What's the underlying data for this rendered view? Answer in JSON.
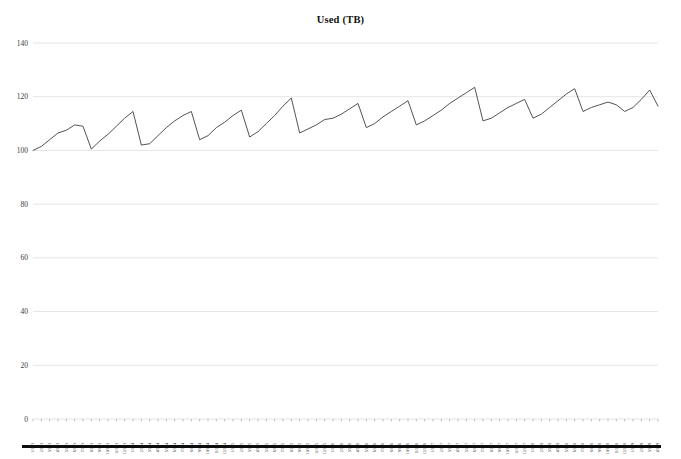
{
  "chart": {
    "title": "Used (TB)",
    "bottom_bar_color": "#0d0d0d",
    "line_color": "#3f3f3f",
    "grid_color": "#d9d9d9"
  },
  "chart_data": {
    "type": "line",
    "title": "Used (TB)",
    "xlabel": "",
    "ylabel": "",
    "ylim": [
      0,
      140
    ],
    "ytick_labels": [
      "0",
      "20",
      "40",
      "60",
      "80",
      "100",
      "120",
      "140"
    ],
    "yticks": [
      0,
      20,
      40,
      60,
      80,
      100,
      120,
      140
    ],
    "grid": true,
    "legend": "none",
    "series_name": "Used (TB)",
    "categories": [
      "1/1/13",
      "2/1/13",
      "3/1/13",
      "4/1/13",
      "5/1/13",
      "6/1/13",
      "7/1/13",
      "8/1/13",
      "9/1/13",
      "10/1/13",
      "11/1/13",
      "12/1/13",
      "1/1/14",
      "2/1/14",
      "3/1/14",
      "4/1/14",
      "5/1/14",
      "6/1/14",
      "7/1/14",
      "8/1/14",
      "9/1/14",
      "10/1/14",
      "11/1/14",
      "12/1/14",
      "1/1/15",
      "2/1/15",
      "3/1/15",
      "4/1/15",
      "5/1/15",
      "6/1/15",
      "7/1/15",
      "8/1/15",
      "9/1/15",
      "10/1/15",
      "11/1/15",
      "12/1/15",
      "1/1/16",
      "2/1/16",
      "3/1/16",
      "4/1/16",
      "5/1/16",
      "6/1/16",
      "7/1/16",
      "8/1/16",
      "9/1/16",
      "10/1/16",
      "11/1/16",
      "12/1/16",
      "1/1/17",
      "2/1/17",
      "3/1/17",
      "4/1/17",
      "5/1/17",
      "6/1/17",
      "7/1/17",
      "8/1/17",
      "9/1/17",
      "10/1/17",
      "11/1/17",
      "12/1/17",
      "1/1/18",
      "2/1/18",
      "3/1/18",
      "4/1/18",
      "5/1/18",
      "6/1/18",
      "7/1/18",
      "8/1/18",
      "9/1/18",
      "10/1/18",
      "11/1/18",
      "12/1/18",
      "1/1/19",
      "2/1/19",
      "3/1/19",
      "4/1/19"
    ],
    "values": [
      100.0,
      101.5,
      104.0,
      106.5,
      107.5,
      109.5,
      109.0,
      100.5,
      103.5,
      106.0,
      109.0,
      112.0,
      114.5,
      102.0,
      102.5,
      105.5,
      108.5,
      111.0,
      113.0,
      114.5,
      104.0,
      105.5,
      108.5,
      110.5,
      113.0,
      115.0,
      105.0,
      107.0,
      110.0,
      113.0,
      116.5,
      119.5,
      106.5,
      108.0,
      109.5,
      111.5,
      112.0,
      113.5,
      115.5,
      117.5,
      108.5,
      110.0,
      112.5,
      114.5,
      116.5,
      118.5,
      109.5,
      111.0,
      113.0,
      115.0,
      117.5,
      119.5,
      121.5,
      123.5,
      111.0,
      112.0,
      114.0,
      116.0,
      117.5,
      119.0,
      112.0,
      113.5,
      116.0,
      118.5,
      121.0,
      123.0,
      114.5,
      116.0,
      117.0,
      118.0,
      117.0,
      114.5,
      116.0,
      119.0,
      122.5,
      116.5
    ]
  }
}
